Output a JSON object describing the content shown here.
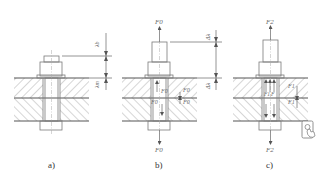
{
  "diagram": {
    "panels": [
      {
        "id": "a",
        "caption": "a)",
        "state": "bolt snug, no preload",
        "labels": {
          "top_dim": "λb",
          "bottom_dim": "λm"
        }
      },
      {
        "id": "b",
        "caption": "b)",
        "state": "preload applied",
        "labels": {
          "top_force": "F0",
          "bottom_force": "F0",
          "bolt_inner_force": "F0",
          "bolt_inner_force_2": "F0",
          "member_force_upper": "F0",
          "member_force_lower": "F0",
          "top_dim": "Δλ",
          "bottom_dim": "Δλ"
        }
      },
      {
        "id": "c",
        "caption": "c)",
        "state": "working load applied",
        "labels": {
          "top_force": "F2",
          "bottom_force": "F2",
          "bolt_inner_force_1": "F1",
          "bolt_inner_force_2": "F",
          "member_force_upper": "F1",
          "member_force_lower": "F1"
        }
      }
    ],
    "icon": "touch-screen-icon",
    "colors": {
      "line": "#7a7a7a",
      "hatch": "#8a8a8a",
      "text": "#6a6a6a"
    }
  }
}
